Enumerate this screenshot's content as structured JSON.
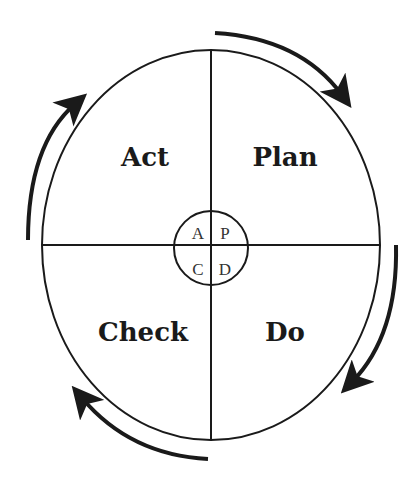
{
  "diagram": {
    "quadrants": [
      {
        "id": "act",
        "label": "Act",
        "position": "top-left"
      },
      {
        "id": "plan",
        "label": "Plan",
        "position": "top-right"
      },
      {
        "id": "check",
        "label": "Check",
        "position": "bottom-left"
      },
      {
        "id": "do",
        "label": "Do",
        "position": "bottom-right"
      }
    ],
    "center_letters": {
      "a": "A",
      "p": "P",
      "c": "C",
      "d": "D"
    },
    "flow_direction": "clockwise",
    "colors": {
      "stroke": "#1a1a1a",
      "background": "#ffffff"
    }
  }
}
